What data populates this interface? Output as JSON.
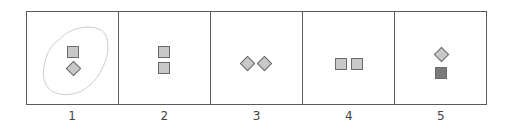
{
  "diagram": {
    "colors": {
      "frame": "#5a5a5a",
      "shape_fill": "#c8c8c8",
      "shape_fill_dark": "#7a7a7a",
      "shape_stroke": "#6a6a6a",
      "loop": "#cccccc"
    },
    "panels": [
      {
        "label": "1",
        "shapes": [
          "square",
          "diamond"
        ],
        "arrangement": "vertical",
        "annotation": "hand-drawn loop circling shapes"
      },
      {
        "label": "2",
        "shapes": [
          "square",
          "square"
        ],
        "arrangement": "vertical"
      },
      {
        "label": "3",
        "shapes": [
          "diamond",
          "diamond"
        ],
        "arrangement": "horizontal"
      },
      {
        "label": "4",
        "shapes": [
          "square",
          "square"
        ],
        "arrangement": "horizontal"
      },
      {
        "label": "5",
        "shapes": [
          "diamond",
          "dark-square"
        ],
        "arrangement": "vertical"
      }
    ]
  }
}
